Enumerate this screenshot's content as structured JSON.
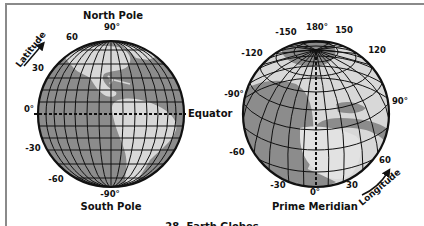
{
  "figure": {
    "caption": "28. Earth Globes",
    "colors": {
      "ocean": "#8c8c8c",
      "land": "#d8d8d8",
      "grid": "#111111",
      "frame": "#8a8a8a",
      "background": "#ffffff"
    }
  },
  "latitude_globe": {
    "top_label": "North Pole",
    "bottom_label": "South Pole",
    "equator_label": "Equator",
    "axis_label": "Latitude",
    "ticks": {
      "t90": "90°",
      "t60": "60",
      "t30": "30",
      "t0": "0°",
      "tm30": "-30",
      "tm60": "-60",
      "tm90": "-90°"
    }
  },
  "longitude_globe": {
    "bottom_label": "Prime Meridian",
    "axis_label": "Longitude",
    "ticks": {
      "t180": "180°",
      "tm150": "-150",
      "t150": "150",
      "tm120": "-120",
      "t120": "120",
      "tm90": "-90°",
      "t90": "90°",
      "tm60": "-60",
      "t60": "60",
      "tm30": "-30",
      "t30": "30",
      "t0": "0°"
    }
  }
}
